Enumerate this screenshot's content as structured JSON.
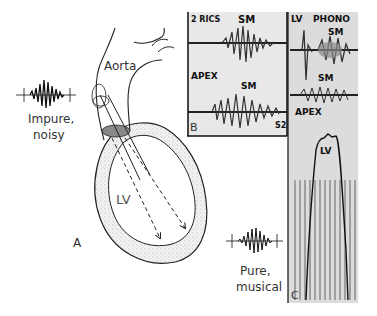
{
  "figure": {
    "panel_a": {
      "letter": "A",
      "aorta_label": "Aorta",
      "lv_label": "LV",
      "impure_caption_line1": "Impure,",
      "impure_caption_line2": "noisy",
      "pure_caption_line1": "Pure,",
      "pure_caption_line2": "musical"
    },
    "panel_b": {
      "letter": "B",
      "top_trace_label": "2 RICS",
      "top_sm_label": "SM",
      "bottom_trace_label": "APEX",
      "bottom_sm_label": "SM",
      "s2_label": "S2"
    },
    "panel_c": {
      "letter": "C",
      "lv_phono_label": "LV",
      "phono_label": "PHONO",
      "sm_label_1": "SM",
      "sm_label_2": "SM",
      "apex_label": "APEX",
      "lv_pressure_label": "LV"
    }
  }
}
